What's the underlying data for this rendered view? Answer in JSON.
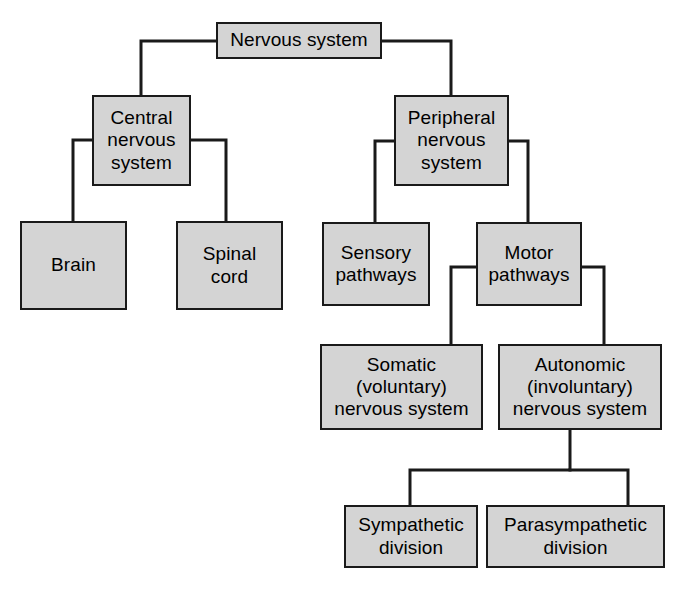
{
  "diagram": {
    "type": "hierarchy-tree",
    "style": {
      "box_fill": "#d4d4d4",
      "box_border": "#1a1a1a",
      "line_color": "#1a1a1a",
      "background": "#ffffff",
      "text_color": "#000000"
    },
    "nodes": [
      {
        "id": "nervous-system",
        "label": "Nervous system",
        "level": 0,
        "x": 216,
        "y": 22,
        "w": 166,
        "h": 37
      },
      {
        "id": "central-nervous-system",
        "label": "Central\nnervous\nsystem",
        "level": 1,
        "x": 92,
        "y": 95,
        "w": 99,
        "h": 91
      },
      {
        "id": "peripheral-nervous-system",
        "label": "Peripheral\nnervous\nsystem",
        "level": 1,
        "x": 394,
        "y": 95,
        "w": 115,
        "h": 91
      },
      {
        "id": "brain",
        "label": "Brain",
        "level": 2,
        "x": 20,
        "y": 221,
        "w": 107,
        "h": 89
      },
      {
        "id": "spinal-cord",
        "label": "Spinal\ncord",
        "level": 2,
        "x": 176,
        "y": 221,
        "w": 107,
        "h": 89
      },
      {
        "id": "sensory-pathways",
        "label": "Sensory\npathways",
        "level": 2,
        "x": 322,
        "y": 222,
        "w": 108,
        "h": 84
      },
      {
        "id": "motor-pathways",
        "label": "Motor\npathways",
        "level": 2,
        "x": 476,
        "y": 222,
        "w": 106,
        "h": 84
      },
      {
        "id": "somatic-nervous-system",
        "label": "Somatic\n(voluntary)\nnervous system",
        "level": 3,
        "x": 320,
        "y": 344,
        "w": 163,
        "h": 86
      },
      {
        "id": "autonomic-nervous-system",
        "label": "Autonomic\n(involuntary)\nnervous system",
        "level": 3,
        "x": 498,
        "y": 344,
        "w": 164,
        "h": 86
      },
      {
        "id": "sympathetic-division",
        "label": "Sympathetic\ndivision",
        "level": 4,
        "x": 344,
        "y": 505,
        "w": 134,
        "h": 63
      },
      {
        "id": "parasympathetic-division",
        "label": "Parasympathetic\ndivision",
        "level": 4,
        "x": 486,
        "y": 505,
        "w": 179,
        "h": 63
      }
    ],
    "edges": [
      {
        "from": "nervous-system",
        "to": "central-nervous-system"
      },
      {
        "from": "nervous-system",
        "to": "peripheral-nervous-system"
      },
      {
        "from": "central-nervous-system",
        "to": "brain"
      },
      {
        "from": "central-nervous-system",
        "to": "spinal-cord"
      },
      {
        "from": "peripheral-nervous-system",
        "to": "sensory-pathways"
      },
      {
        "from": "peripheral-nervous-system",
        "to": "motor-pathways"
      },
      {
        "from": "motor-pathways",
        "to": "somatic-nervous-system"
      },
      {
        "from": "motor-pathways",
        "to": "autonomic-nervous-system"
      },
      {
        "from": "autonomic-nervous-system",
        "to": "sympathetic-division"
      },
      {
        "from": "autonomic-nervous-system",
        "to": "parasympathetic-division"
      }
    ],
    "edge_paths": [
      "M 216 41 H 141 V 95",
      "M 382 41 H 451 V 95",
      "M 92 140 H 73 V 221",
      "M 191 140 H 226 V 221",
      "M 394 141 H 375 V 222",
      "M 509 141 H 528 V 222",
      "M 476 267 H 451 V 344",
      "M 582 267 H 604 V 344",
      "M 570 430 V 470 H 410 V 505",
      "M 570 470 H 628 V 505"
    ]
  }
}
